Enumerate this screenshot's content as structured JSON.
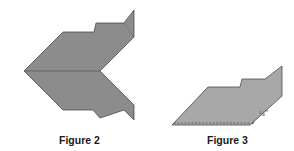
{
  "figures": [
    {
      "id": "figure-2",
      "caption": "Figure 2",
      "description": "Chevron of strip-pieced fabric strips folded into a V shape"
    },
    {
      "id": "figure-3",
      "caption": "Figure 3",
      "description": "Strip set folded with seam allowance marked",
      "dimension_label": "¼\""
    }
  ],
  "colors": {
    "dark": "#3a3a3a",
    "mid_dark": "#6e6e6e",
    "mid": "#8c8c8c",
    "light": "#a8a8a8",
    "lighter": "#c4c4c4",
    "outline": "#4a4a4a"
  }
}
